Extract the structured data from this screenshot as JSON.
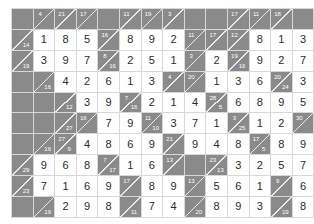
{
  "puzzle": {
    "type": "kakuro",
    "name": "kakuro-solution-grid",
    "rows": 10,
    "cols": 10,
    "colors": {
      "block": "#8a8a8a",
      "entry_background": "#ffffff",
      "gridline": "#d8d8d8",
      "diagonal": "#e9e9e9",
      "clue_text": "#ffffff",
      "entry_text": "#2b2b2b"
    },
    "legend": {
      "block_label": "block",
      "entry_label": "entry",
      "clue_label": "clue"
    },
    "grid": [
      [
        {
          "kind": "block"
        },
        {
          "kind": "clue",
          "down": "4",
          "right": ""
        },
        {
          "kind": "clue",
          "down": "21",
          "right": ""
        },
        {
          "kind": "clue",
          "down": "17",
          "right": ""
        },
        {
          "kind": "block"
        },
        {
          "kind": "clue",
          "down": "11",
          "right": ""
        },
        {
          "kind": "clue",
          "down": "19",
          "right": ""
        },
        {
          "kind": "clue",
          "down": "3",
          "right": ""
        },
        {
          "kind": "block"
        },
        {
          "kind": "block"
        }
      ],
      [
        {
          "kind": "clue",
          "down": "",
          "right": "14"
        },
        {
          "kind": "entry",
          "value": "1"
        },
        {
          "kind": "entry",
          "value": "8"
        },
        {
          "kind": "entry",
          "value": "5"
        },
        {
          "kind": "clue",
          "down": "16",
          "right": ""
        },
        {
          "kind": "entry",
          "value": "8"
        },
        {
          "kind": "entry",
          "value": "9"
        },
        {
          "kind": "entry",
          "value": "2"
        },
        {
          "kind": "clue",
          "down": "11",
          "right": ""
        },
        {
          "kind": "clue",
          "down": "17",
          "right": ""
        }
      ],
      [
        {
          "kind": "clue",
          "down": "",
          "right": "19"
        },
        {
          "kind": "entry",
          "value": "3"
        },
        {
          "kind": "entry",
          "value": "9"
        },
        {
          "kind": "entry",
          "value": "7"
        },
        {
          "kind": "clue",
          "down": "8",
          "right": "16"
        },
        {
          "kind": "entry",
          "value": "2"
        },
        {
          "kind": "entry",
          "value": "5"
        },
        {
          "kind": "entry",
          "value": "1"
        },
        {
          "kind": "clue",
          "down": "3",
          "right": ""
        },
        {
          "kind": "entry",
          "value": "2"
        }
      ],
      [
        {
          "kind": "block"
        },
        {
          "kind": "clue",
          "down": "",
          "right": "16"
        },
        {
          "kind": "entry",
          "value": "4"
        },
        {
          "kind": "entry",
          "value": "2"
        },
        {
          "kind": "entry",
          "value": "6"
        },
        {
          "kind": "entry",
          "value": "1"
        },
        {
          "kind": "entry",
          "value": "3"
        },
        {
          "kind": "clue",
          "down": "4",
          "right": ""
        },
        {
          "kind": "clue",
          "down": "20",
          "right": ""
        },
        {
          "kind": "entry",
          "value": "1"
        }
      ],
      [
        {
          "kind": "block"
        },
        {
          "kind": "block"
        },
        {
          "kind": "clue",
          "down": "",
          "right": "12"
        },
        {
          "kind": "entry",
          "value": "3"
        },
        {
          "kind": "entry",
          "value": "9"
        },
        {
          "kind": "clue",
          "down": "7",
          "right": "16"
        },
        {
          "kind": "entry",
          "value": "2"
        },
        {
          "kind": "entry",
          "value": "1"
        },
        {
          "kind": "entry",
          "value": "4"
        },
        {
          "kind": "clue",
          "down": "28",
          "right": "5"
        }
      ],
      [
        {
          "kind": "block"
        },
        {
          "kind": "block"
        },
        {
          "kind": "clue",
          "down": "",
          "right": "27"
        },
        {
          "kind": "clue",
          "down": "16",
          "right": ""
        },
        {
          "kind": "entry",
          "value": "7"
        },
        {
          "kind": "entry",
          "value": "9"
        },
        {
          "kind": "clue",
          "down": "11",
          "right": "10"
        },
        {
          "kind": "entry",
          "value": "3"
        },
        {
          "kind": "entry",
          "value": "7"
        },
        {
          "kind": "entry",
          "value": "1"
        }
      ],
      [
        {
          "kind": "block"
        },
        {
          "kind": "clue",
          "down": "",
          "right": "16"
        },
        {
          "kind": "clue",
          "down": "27",
          "right": "9"
        },
        {
          "kind": "entry",
          "value": "4"
        },
        {
          "kind": "entry",
          "value": "8"
        },
        {
          "kind": "entry",
          "value": "6"
        },
        {
          "kind": "entry",
          "value": "9"
        },
        {
          "kind": "clue",
          "down": "21",
          "right": ""
        },
        {
          "kind": "entry",
          "value": "9"
        },
        {
          "kind": "entry",
          "value": "4"
        }
      ],
      [
        {
          "kind": "clue",
          "down": "",
          "right": "29"
        },
        {
          "kind": "entry",
          "value": "9"
        },
        {
          "kind": "entry",
          "value": "6"
        },
        {
          "kind": "entry",
          "value": "8"
        },
        {
          "kind": "clue",
          "down": "7",
          "right": "17"
        },
        {
          "kind": "entry",
          "value": "1"
        },
        {
          "kind": "entry",
          "value": "6"
        },
        {
          "kind": "clue",
          "down": "13",
          "right": ""
        },
        {
          "kind": "block"
        },
        {
          "kind": "clue",
          "down": "23",
          "right": "13"
        }
      ],
      [
        {
          "kind": "clue",
          "down": "",
          "right": "23"
        },
        {
          "kind": "entry",
          "value": "7"
        },
        {
          "kind": "entry",
          "value": "1"
        },
        {
          "kind": "entry",
          "value": "6"
        },
        {
          "kind": "entry",
          "value": "9"
        },
        {
          "kind": "clue",
          "down": "17",
          "right": ""
        },
        {
          "kind": "entry",
          "value": "8"
        },
        {
          "kind": "entry",
          "value": "9"
        },
        {
          "kind": "clue",
          "down": "13",
          "right": ""
        },
        {
          "kind": "entry",
          "value": "5"
        }
      ],
      [
        {
          "kind": "block"
        },
        {
          "kind": "clue",
          "down": "",
          "right": "19"
        },
        {
          "kind": "entry",
          "value": "2"
        },
        {
          "kind": "entry",
          "value": "9"
        },
        {
          "kind": "entry",
          "value": "8"
        },
        {
          "kind": "clue",
          "down": "",
          "right": "11"
        },
        {
          "kind": "entry",
          "value": "7"
        },
        {
          "kind": "entry",
          "value": "4"
        },
        {
          "kind": "clue",
          "down": "",
          "right": "20"
        },
        {
          "kind": "entry",
          "value": "8"
        }
      ]
    ],
    "grid_right": [
      [
        {
          "kind": "clue",
          "down": "17",
          "right": ""
        },
        {
          "kind": "clue",
          "down": "11",
          "right": ""
        },
        {
          "kind": "clue",
          "down": "18",
          "right": ""
        },
        {
          "kind": "block"
        }
      ],
      [
        {
          "kind": "clue",
          "down": "12",
          "right": ""
        },
        {
          "kind": "entry",
          "value": "8"
        },
        {
          "kind": "entry",
          "value": "1"
        },
        {
          "kind": "entry",
          "value": "3"
        }
      ],
      [
        {
          "kind": "clue",
          "down": "19",
          "right": "16"
        },
        {
          "kind": "entry",
          "value": "9"
        },
        {
          "kind": "entry",
          "value": "2"
        },
        {
          "kind": "entry",
          "value": "7"
        }
      ],
      [
        {
          "kind": "entry",
          "value": "3"
        },
        {
          "kind": "entry",
          "value": "6"
        },
        {
          "kind": "clue",
          "down": "20",
          "right": "24"
        },
        {
          "kind": "entry",
          "value": "3"
        }
      ],
      [
        {
          "kind": "entry",
          "value": "6"
        },
        {
          "kind": "entry",
          "value": "8"
        },
        {
          "kind": "entry",
          "value": "9"
        },
        {
          "kind": "entry",
          "value": "5"
        }
      ],
      [
        {
          "kind": "clue",
          "down": "3",
          "right": "25"
        },
        {
          "kind": "entry",
          "value": "1"
        },
        {
          "kind": "entry",
          "value": "2"
        },
        {
          "kind": "clue",
          "down": "30",
          "right": ""
        }
      ],
      [
        {
          "kind": "entry",
          "value": "8"
        },
        {
          "kind": "clue",
          "down": "17",
          "right": "5"
        },
        {
          "kind": "entry",
          "value": "8"
        },
        {
          "kind": "entry",
          "value": "9"
        }
      ],
      [
        {
          "kind": "entry",
          "value": "3"
        },
        {
          "kind": "entry",
          "value": "2"
        },
        {
          "kind": "entry",
          "value": "5"
        },
        {
          "kind": "entry",
          "value": "7"
        }
      ],
      [
        {
          "kind": "entry",
          "value": "6"
        },
        {
          "kind": "entry",
          "value": "1"
        },
        {
          "kind": "clue",
          "down": "9",
          "right": ""
        },
        {
          "kind": "entry",
          "value": "6"
        }
      ],
      [
        {
          "kind": "entry",
          "value": "9"
        },
        {
          "kind": "entry",
          "value": "3"
        },
        {
          "kind": "clue",
          "down": "",
          "right": "19"
        },
        {
          "kind": "entry",
          "value": "8"
        }
      ]
    ]
  }
}
